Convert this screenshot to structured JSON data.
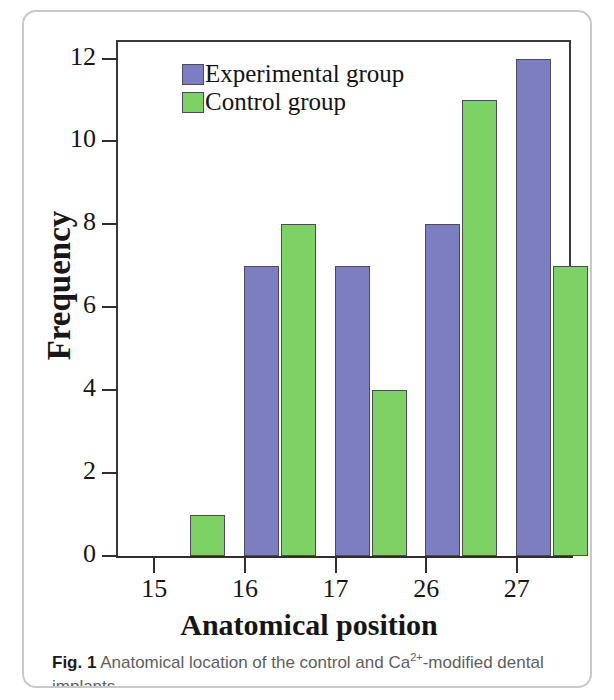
{
  "figure": {
    "caption_prefix": "Fig. 1",
    "caption_text": " Anatomical location of the control and Ca",
    "caption_sup": "2+",
    "caption_tail": "-modified dental implants"
  },
  "chart_data": {
    "type": "bar",
    "title": "",
    "xlabel": "Anatomical position",
    "ylabel": "Frequency",
    "categories": [
      "15",
      "16",
      "17",
      "26",
      "27"
    ],
    "series": [
      {
        "name": "Experimental group",
        "color": "#7d7dc2",
        "values": [
          0,
          7,
          7,
          8,
          12
        ]
      },
      {
        "name": "Control group",
        "color": "#7ed165",
        "values": [
          1,
          8,
          4,
          11,
          7
        ]
      }
    ],
    "ylim": [
      0,
      12.4
    ],
    "yticks": [
      0,
      2,
      4,
      6,
      8,
      10,
      12
    ],
    "ytick_labels": [
      "0",
      "2",
      "4",
      "6",
      "8",
      "10",
      "12"
    ],
    "grid": false,
    "legend_position": "upper-left-inside",
    "bar_edge_color": "#4c4c56",
    "axis_color": "#2e2e2e"
  }
}
